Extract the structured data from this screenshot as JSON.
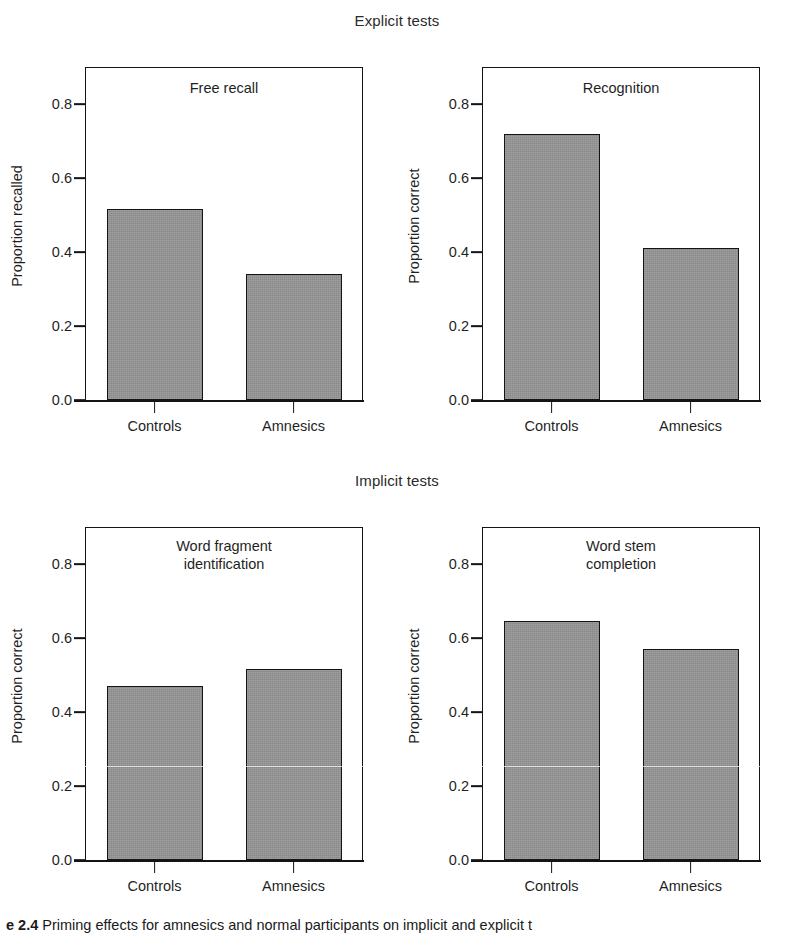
{
  "sections": {
    "explicit": "Explicit tests",
    "implicit": "Implicit tests"
  },
  "categories": [
    "Controls",
    "Amnesics"
  ],
  "ticks": [
    "0.0",
    "0.2",
    "0.4",
    "0.6",
    "0.8"
  ],
  "caption": {
    "figure_number": "e 2.4",
    "text": "Priming effects for amnesics and normal participants on implicit and explicit t"
  },
  "panels": [
    {
      "title_line1": "Free recall",
      "title_line2": "",
      "ylabel": "Proportion recalled",
      "values": [
        0.515,
        0.34
      ]
    },
    {
      "title_line1": "Recognition",
      "title_line2": "",
      "ylabel": "Proportion correct",
      "values": [
        0.72,
        0.41
      ]
    },
    {
      "title_line1": "Word fragment",
      "title_line2": "identification",
      "ylabel": "Proportion correct",
      "values": [
        0.47,
        0.515
      ]
    },
    {
      "title_line1": "Word stem",
      "title_line2": "completion",
      "ylabel": "Proportion correct",
      "values": [
        0.645,
        0.57
      ]
    }
  ],
  "chart_data": {
    "type": "bar",
    "categories": [
      "Controls",
      "Amnesics"
    ],
    "ylim": [
      0.0,
      0.9
    ],
    "yticks": [
      0.0,
      0.2,
      0.4,
      0.6,
      0.8
    ],
    "grid": false,
    "legend": "none",
    "bar_color": "#969696",
    "bar_edge_color": "#141414",
    "panels": [
      {
        "panel": "Free recall",
        "group": "Explicit tests",
        "ylabel": "Proportion recalled",
        "xlabel": "",
        "categories": [
          "Controls",
          "Amnesics"
        ],
        "values": [
          0.515,
          0.34
        ]
      },
      {
        "panel": "Recognition",
        "group": "Explicit tests",
        "ylabel": "Proportion correct",
        "xlabel": "",
        "categories": [
          "Controls",
          "Amnesics"
        ],
        "values": [
          0.72,
          0.41
        ]
      },
      {
        "panel": "Word fragment identification",
        "group": "Implicit tests",
        "ylabel": "Proportion correct",
        "xlabel": "",
        "categories": [
          "Controls",
          "Amnesics"
        ],
        "values": [
          0.47,
          0.515
        ]
      },
      {
        "panel": "Word stem completion",
        "group": "Implicit tests",
        "ylabel": "Proportion correct",
        "xlabel": "",
        "categories": [
          "Controls",
          "Amnesics"
        ],
        "values": [
          0.645,
          0.57
        ]
      }
    ]
  }
}
